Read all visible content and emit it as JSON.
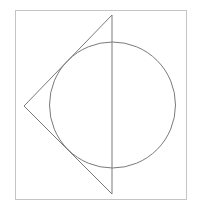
{
  "figure": {
    "width": 199,
    "height": 214,
    "background": "#ffffff",
    "frame": {
      "x": 15.5,
      "y": 10.5,
      "width": 171,
      "height": 189,
      "stroke": "#c4c4c4",
      "stroke_width": 1
    },
    "triangle": {
      "points": [
        [
          112,
          15
        ],
        [
          24,
          106
        ],
        [
          112,
          194
        ]
      ],
      "stroke": "#7a7a7a",
      "stroke_width": 1
    },
    "circle": {
      "cx": 112.5,
      "cy": 105,
      "r": 63,
      "stroke": "#7a7a7a",
      "stroke_width": 1
    }
  }
}
